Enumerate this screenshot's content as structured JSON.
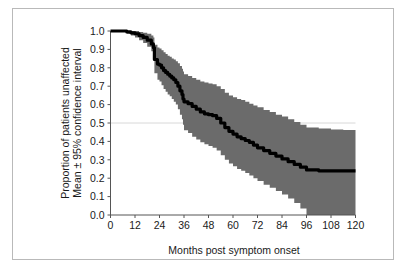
{
  "figure": {
    "border_color": "#b9b9b9",
    "background_color": "#ffffff"
  },
  "chart_data": {
    "type": "line",
    "title": "",
    "subtitle": "",
    "xlabel": "Months post symptom onset",
    "ylabel": "Proportion of patients unaffected\nMean ± 95% confidence interval",
    "ylabel_line1": "Proportion of patients unaffected",
    "ylabel_line2": "Mean ± 95% confidence interval",
    "xlim": [
      0,
      120
    ],
    "ylim": [
      0.0,
      1.0
    ],
    "xticks": [
      0,
      12,
      24,
      36,
      48,
      60,
      72,
      84,
      96,
      108,
      120
    ],
    "xtick_labels": [
      "0",
      "12",
      "24",
      "36",
      "48",
      "60",
      "72",
      "84",
      "96",
      "108",
      "120"
    ],
    "yticks": [
      0.0,
      0.1,
      0.2,
      0.3,
      0.4,
      0.5,
      0.6,
      0.7,
      0.8,
      0.9,
      1.0
    ],
    "ytick_labels": [
      "0.0",
      "0.1",
      "0.2",
      "0.3",
      "0.4",
      "0.5",
      "0.6",
      "0.7",
      "0.8",
      "0.9",
      "1.0"
    ],
    "grid": true,
    "gridlines_y": [
      0.5
    ],
    "gridline_color": "#d8d8d8",
    "legend": null,
    "legend_position": "none",
    "series": [
      {
        "name": "Mean proportion unaffected",
        "kind": "step-line",
        "color": "#000000",
        "line_width": 3.2,
        "x": [
          0,
          4,
          8,
          10,
          12,
          14,
          16,
          18,
          20,
          21,
          21.5,
          23,
          24,
          25,
          26,
          27,
          28,
          29,
          30,
          31,
          32,
          33,
          34,
          35,
          35.5,
          36,
          38,
          40,
          42,
          44,
          46,
          48,
          50,
          52,
          54,
          56,
          58,
          60,
          62,
          64,
          66,
          68,
          70,
          72,
          75,
          78,
          81,
          84,
          87,
          90,
          93,
          96,
          102,
          108,
          114,
          120
        ],
        "y": [
          1.0,
          1.0,
          0.995,
          0.99,
          0.985,
          0.975,
          0.965,
          0.95,
          0.93,
          0.91,
          0.845,
          0.82,
          0.815,
          0.8,
          0.785,
          0.775,
          0.765,
          0.755,
          0.745,
          0.735,
          0.72,
          0.7,
          0.675,
          0.655,
          0.63,
          0.615,
          0.605,
          0.59,
          0.575,
          0.56,
          0.55,
          0.545,
          0.54,
          0.525,
          0.5,
          0.475,
          0.455,
          0.44,
          0.425,
          0.415,
          0.405,
          0.395,
          0.38,
          0.365,
          0.35,
          0.335,
          0.32,
          0.305,
          0.29,
          0.275,
          0.26,
          0.245,
          0.24,
          0.24,
          0.24,
          0.24
        ]
      }
    ],
    "confidence_band": {
      "name": "95% confidence interval",
      "fill_color": "#6b6b6b",
      "opacity": 1.0,
      "x": [
        0,
        4,
        8,
        10,
        12,
        14,
        16,
        18,
        20,
        21,
        21.5,
        23,
        24,
        25,
        26,
        27,
        28,
        29,
        30,
        31,
        32,
        33,
        34,
        35,
        35.5,
        36,
        38,
        40,
        42,
        44,
        46,
        48,
        50,
        52,
        54,
        56,
        58,
        60,
        62,
        64,
        66,
        68,
        70,
        72,
        75,
        78,
        81,
        84,
        87,
        90,
        93,
        96,
        102,
        108,
        114,
        120
      ],
      "upper": [
        1.0,
        1.0,
        1.0,
        1.0,
        1.0,
        0.995,
        0.99,
        0.985,
        0.975,
        0.965,
        0.925,
        0.91,
        0.905,
        0.895,
        0.885,
        0.875,
        0.865,
        0.86,
        0.85,
        0.845,
        0.835,
        0.825,
        0.81,
        0.795,
        0.78,
        0.765,
        0.755,
        0.745,
        0.735,
        0.725,
        0.72,
        0.715,
        0.71,
        0.7,
        0.685,
        0.665,
        0.65,
        0.64,
        0.63,
        0.625,
        0.615,
        0.605,
        0.595,
        0.585,
        0.57,
        0.56,
        0.545,
        0.535,
        0.52,
        0.505,
        0.49,
        0.475,
        0.47,
        0.465,
        0.462,
        0.46
      ],
      "lower": [
        1.0,
        0.995,
        0.985,
        0.975,
        0.965,
        0.95,
        0.935,
        0.915,
        0.89,
        0.865,
        0.77,
        0.735,
        0.725,
        0.705,
        0.685,
        0.67,
        0.655,
        0.645,
        0.63,
        0.615,
        0.6,
        0.575,
        0.545,
        0.52,
        0.49,
        0.46,
        0.445,
        0.425,
        0.41,
        0.395,
        0.385,
        0.375,
        0.365,
        0.35,
        0.325,
        0.3,
        0.28,
        0.265,
        0.25,
        0.24,
        0.228,
        0.215,
        0.2,
        0.185,
        0.165,
        0.148,
        0.13,
        0.112,
        0.09,
        0.065,
        0.035,
        0.0,
        0.0,
        0.0,
        0.0,
        0.0
      ]
    },
    "annotations": []
  }
}
